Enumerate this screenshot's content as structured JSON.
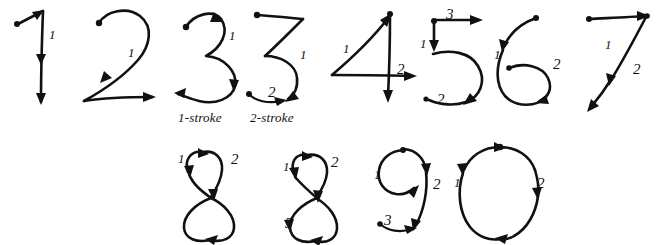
{
  "figure": {
    "background_color": "#ffffff",
    "ink_color": "#111111",
    "width": 660,
    "height": 245
  },
  "captions": [
    {
      "id": "caption-1-stroke",
      "text": "1-stroke",
      "x": 178,
      "y": 110
    },
    {
      "id": "caption-2-stroke",
      "text": "2-stroke",
      "x": 250,
      "y": 110
    }
  ],
  "glyphs": [
    {
      "id": "digit-1",
      "digit": "1",
      "variant": "",
      "stroke_count": 1,
      "row": "top",
      "labels": [
        {
          "text": "1",
          "x": 49,
          "y": 28
        }
      ]
    },
    {
      "id": "digit-2",
      "digit": "2",
      "variant": "",
      "stroke_count": 1,
      "row": "top",
      "labels": [
        {
          "text": "1",
          "x": 128,
          "y": 46
        }
      ]
    },
    {
      "id": "digit-3-one-stroke",
      "digit": "3",
      "variant": "1-stroke",
      "stroke_count": 1,
      "row": "top",
      "labels": [
        {
          "text": "1",
          "x": 229,
          "y": 29
        }
      ]
    },
    {
      "id": "digit-3-two-stroke",
      "digit": "3",
      "variant": "2-stroke",
      "stroke_count": 2,
      "row": "top",
      "labels": [
        {
          "text": "1",
          "x": 300,
          "y": 48
        },
        {
          "text": "2",
          "x": 268,
          "y": 85
        }
      ]
    },
    {
      "id": "digit-4",
      "digit": "4",
      "variant": "",
      "stroke_count": 2,
      "row": "top",
      "labels": [
        {
          "text": "1",
          "x": 343,
          "y": 42
        },
        {
          "text": "2",
          "x": 397,
          "y": 62
        }
      ]
    },
    {
      "id": "digit-5",
      "digit": "5",
      "variant": "",
      "stroke_count": 3,
      "row": "top",
      "labels": [
        {
          "text": "1",
          "x": 420,
          "y": 37
        },
        {
          "text": "2",
          "x": 437,
          "y": 92
        },
        {
          "text": "3",
          "x": 446,
          "y": 7
        }
      ]
    },
    {
      "id": "digit-6",
      "digit": "6",
      "variant": "",
      "stroke_count": 2,
      "row": "top",
      "labels": [
        {
          "text": "1",
          "x": 494,
          "y": 48
        },
        {
          "text": "2",
          "x": 553,
          "y": 57
        }
      ]
    },
    {
      "id": "digit-7",
      "digit": "7",
      "variant": "",
      "stroke_count": 2,
      "row": "top",
      "labels": [
        {
          "text": "1",
          "x": 605,
          "y": 38
        },
        {
          "text": "2",
          "x": 633,
          "y": 62
        }
      ]
    },
    {
      "id": "digit-8-two-stroke",
      "digit": "8",
      "variant": "2-stroke",
      "stroke_count": 2,
      "row": "bottom",
      "labels": [
        {
          "text": "1",
          "x": 178,
          "y": 152
        },
        {
          "text": "2",
          "x": 231,
          "y": 152
        }
      ]
    },
    {
      "id": "digit-8-three-stroke",
      "digit": "8",
      "variant": "3-stroke",
      "stroke_count": 3,
      "row": "bottom",
      "labels": [
        {
          "text": "1",
          "x": 283,
          "y": 160
        },
        {
          "text": "2",
          "x": 331,
          "y": 155
        },
        {
          "text": "3",
          "x": 285,
          "y": 216
        }
      ]
    },
    {
      "id": "digit-9",
      "digit": "9",
      "variant": "",
      "stroke_count": 3,
      "row": "bottom",
      "labels": [
        {
          "text": "1",
          "x": 374,
          "y": 168
        },
        {
          "text": "2",
          "x": 433,
          "y": 177
        },
        {
          "text": "3",
          "x": 384,
          "y": 213
        }
      ]
    },
    {
      "id": "digit-0",
      "digit": "0",
      "variant": "",
      "stroke_count": 2,
      "row": "bottom",
      "labels": [
        {
          "text": "1",
          "x": 454,
          "y": 176
        },
        {
          "text": "2",
          "x": 537,
          "y": 176
        }
      ]
    }
  ]
}
